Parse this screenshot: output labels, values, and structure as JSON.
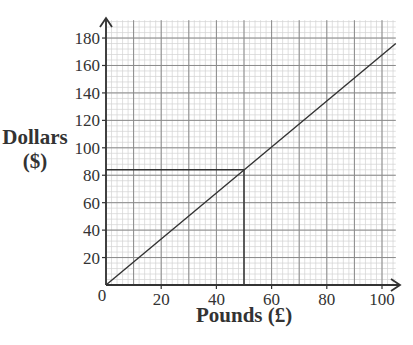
{
  "chart_data": {
    "type": "line",
    "title": "",
    "xlabel": "Pounds (£)",
    "ylabel_line1": "Dollars",
    "ylabel_line2": "($)",
    "xlim": [
      0,
      105
    ],
    "ylim": [
      0,
      193
    ],
    "x_ticks": [
      0,
      20,
      40,
      60,
      80,
      100
    ],
    "y_ticks": [
      20,
      40,
      60,
      80,
      100,
      120,
      140,
      160,
      180
    ],
    "origin_label": "0",
    "grid": {
      "major_x_step": 10,
      "major_y_step": 20,
      "minor_x_step": 2,
      "minor_y_step": 4,
      "on": true
    },
    "series": [
      {
        "name": "Pounds to Dollars conversion",
        "x": [
          0,
          105
        ],
        "y": [
          0,
          176
        ],
        "color": "#333333"
      }
    ],
    "annotations": [
      {
        "type": "reading_line",
        "x": 50,
        "y": 84,
        "description": "Vertical from x=50 up to line, horizontal across to y≈84"
      }
    ],
    "legend": null
  },
  "colors": {
    "axis": "#333333",
    "major_grid": "#8a8a8a",
    "minor_grid": "#d2d2d2",
    "line": "#333333"
  }
}
